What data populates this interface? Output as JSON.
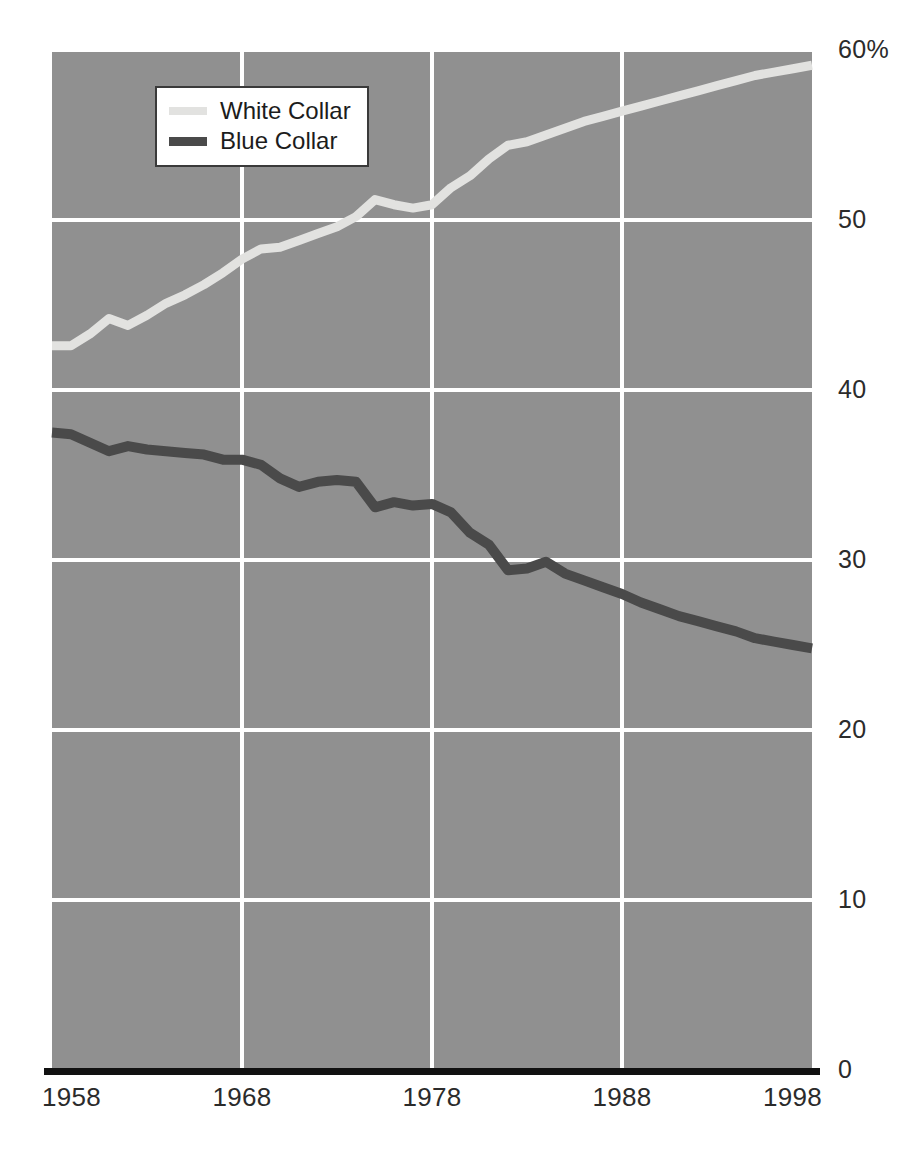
{
  "chart_data": {
    "type": "line",
    "title": "",
    "subtitle": "",
    "xlabel": "",
    "ylabel": "",
    "xlim": [
      1958,
      1998
    ],
    "ylim": [
      0,
      60
    ],
    "grid": true,
    "grid_color": "#ffffff",
    "plot_background": "#909090",
    "axis_line_color": "#111111",
    "legend_position": "top-left-inside",
    "x_tick_labels": [
      "1958",
      "1968",
      "1978",
      "1988",
      "1998"
    ],
    "x_ticks": [
      1958,
      1968,
      1978,
      1988,
      1998
    ],
    "y_tick_labels": [
      "0",
      "10",
      "20",
      "30",
      "40",
      "50",
      "60%"
    ],
    "y_ticks": [
      0,
      10,
      20,
      30,
      40,
      50,
      60
    ],
    "y_unit": "%",
    "x": [
      1958,
      1959,
      1960,
      1961,
      1962,
      1963,
      1964,
      1965,
      1966,
      1967,
      1968,
      1969,
      1970,
      1971,
      1972,
      1973,
      1974,
      1975,
      1976,
      1977,
      1978,
      1979,
      1980,
      1981,
      1982,
      1983,
      1984,
      1985,
      1986,
      1987,
      1988,
      1989,
      1990,
      1991,
      1992,
      1993,
      1994,
      1995,
      1996,
      1997,
      1998
    ],
    "series": [
      {
        "name": "White Collar",
        "color": "#e2e2e0",
        "line_width": 9,
        "values": [
          42.6,
          42.6,
          43.3,
          44.2,
          43.8,
          44.4,
          45.1,
          45.6,
          46.2,
          46.9,
          47.7,
          48.3,
          48.4,
          48.8,
          49.2,
          49.6,
          50.2,
          51.2,
          50.9,
          50.7,
          50.9,
          51.9,
          52.6,
          53.6,
          54.4,
          54.6,
          55.0,
          55.4,
          55.8,
          56.1,
          56.4,
          56.7,
          57.0,
          57.3,
          57.6,
          57.9,
          58.2,
          58.5,
          58.7,
          58.9,
          59.1
        ]
      },
      {
        "name": "Blue Collar",
        "color": "#4a4a4a",
        "line_width": 10,
        "values": [
          37.5,
          37.4,
          36.9,
          36.4,
          36.7,
          36.5,
          36.4,
          36.3,
          36.2,
          35.9,
          35.9,
          35.6,
          34.8,
          34.3,
          34.6,
          34.7,
          34.6,
          33.1,
          33.4,
          33.2,
          33.3,
          32.8,
          31.6,
          30.9,
          29.4,
          29.5,
          29.9,
          29.2,
          28.8,
          28.4,
          28.0,
          27.5,
          27.1,
          26.7,
          26.4,
          26.1,
          25.8,
          25.4,
          25.2,
          25.0,
          24.8
        ]
      }
    ]
  },
  "legend": {
    "items": [
      {
        "label": "White Collar",
        "color": "#e2e2e0"
      },
      {
        "label": "Blue Collar",
        "color": "#4a4a4a"
      }
    ]
  },
  "geometry": {
    "plot_left": 52,
    "plot_right": 812,
    "plot_top": 50,
    "plot_bottom": 1070
  }
}
